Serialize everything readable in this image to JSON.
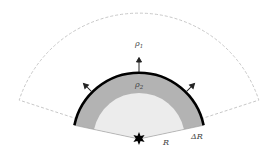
{
  "diagram": {
    "labels": {
      "outer_density": "ρ",
      "outer_density_sub": "1",
      "shell_density": "ρ",
      "shell_density_sub": "2",
      "radius": "R",
      "shell_thickness": "ΔR"
    },
    "colors": {
      "inner_region": "#ececec",
      "shell": "#b3b3b3",
      "boundary": "#000000",
      "dashed_outline": "#c8c8c8",
      "arrows": "#222222",
      "source": "#000000"
    },
    "elements": [
      "outer dashed sector",
      "shell of density ρ2",
      "inner region",
      "thick boundary arc",
      "three outward arrows",
      "star-shaped source at center"
    ]
  }
}
